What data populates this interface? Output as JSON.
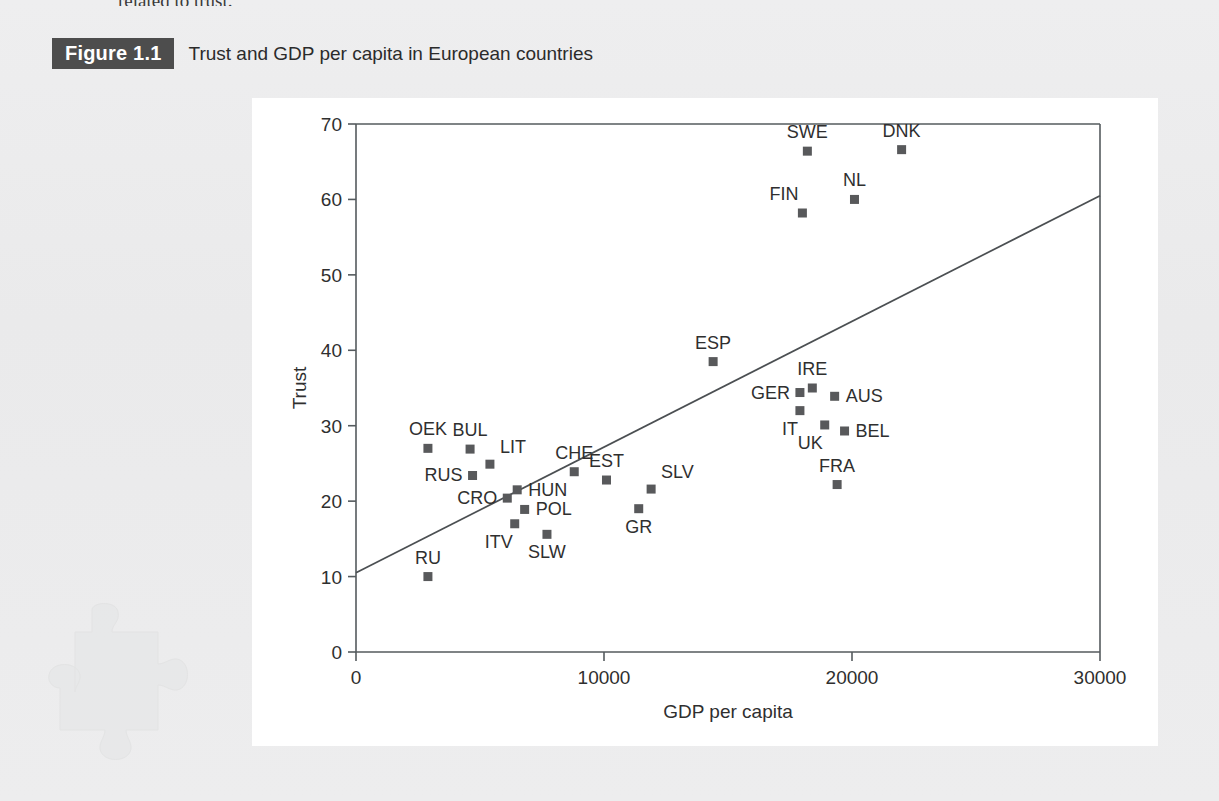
{
  "page": {
    "partial_body_text": "related to trust.",
    "background_color": "#ecedee",
    "panel_color": "#ffffff"
  },
  "figure": {
    "badge_label": "Figure 1.1",
    "badge_bg": "#4d4d4d",
    "title": "Trust and GDP per capita in European countries"
  },
  "watermark": {
    "name": "puzzle-piece",
    "color": "#e3e4e5"
  },
  "chart_data": {
    "type": "scatter",
    "title": "Trust and GDP per capita in European countries",
    "xlabel": "GDP per capita",
    "ylabel": "Trust",
    "xlim": [
      0,
      30000
    ],
    "ylim": [
      0,
      70
    ],
    "xticks": [
      0,
      10000,
      20000,
      30000
    ],
    "yticks": [
      0,
      10,
      20,
      30,
      40,
      50,
      60,
      70
    ],
    "xtick_labels": [
      "0",
      "10000",
      "20000",
      "30000"
    ],
    "ytick_labels": [
      "0",
      "10",
      "20",
      "30",
      "40",
      "50",
      "60",
      "70"
    ],
    "grid": false,
    "legend": "none",
    "marker_color": "#58595b",
    "marker_shape": "square",
    "trendline": {
      "name": "linear-fit",
      "x": [
        0,
        30000
      ],
      "y": [
        10.5,
        60.5
      ],
      "color": "#4b4f52"
    },
    "points": [
      {
        "label": "SWE",
        "x": 18200,
        "y": 66.4,
        "label_pos": "above"
      },
      {
        "label": "DNK",
        "x": 22000,
        "y": 66.6,
        "label_pos": "above"
      },
      {
        "label": "FIN",
        "x": 18000,
        "y": 58.2,
        "label_pos": "above-left"
      },
      {
        "label": "NL",
        "x": 20100,
        "y": 60.0,
        "label_pos": "above"
      },
      {
        "label": "ESP",
        "x": 14400,
        "y": 38.5,
        "label_pos": "above"
      },
      {
        "label": "IRE",
        "x": 18400,
        "y": 35.0,
        "label_pos": "above"
      },
      {
        "label": "GER",
        "x": 17900,
        "y": 34.4,
        "label_pos": "left"
      },
      {
        "label": "AUS",
        "x": 19300,
        "y": 33.9,
        "label_pos": "right"
      },
      {
        "label": "IT",
        "x": 17900,
        "y": 32.0,
        "label_pos": "below-left"
      },
      {
        "label": "UK",
        "x": 18900,
        "y": 30.1,
        "label_pos": "below-left"
      },
      {
        "label": "BEL",
        "x": 19700,
        "y": 29.3,
        "label_pos": "right"
      },
      {
        "label": "FRA",
        "x": 19400,
        "y": 22.2,
        "label_pos": "above"
      },
      {
        "label": "OEK",
        "x": 2900,
        "y": 27.0,
        "label_pos": "above"
      },
      {
        "label": "BUL",
        "x": 4600,
        "y": 26.9,
        "label_pos": "above"
      },
      {
        "label": "LIT",
        "x": 5400,
        "y": 24.9,
        "label_pos": "above-right"
      },
      {
        "label": "RUS",
        "x": 4700,
        "y": 23.4,
        "label_pos": "left"
      },
      {
        "label": "CHE",
        "x": 8800,
        "y": 23.9,
        "label_pos": "above"
      },
      {
        "label": "EST",
        "x": 10100,
        "y": 22.8,
        "label_pos": "above"
      },
      {
        "label": "SLV",
        "x": 11900,
        "y": 21.6,
        "label_pos": "above-right"
      },
      {
        "label": "CRO",
        "x": 6100,
        "y": 20.4,
        "label_pos": "left"
      },
      {
        "label": "HUN",
        "x": 6500,
        "y": 21.5,
        "label_pos": "right"
      },
      {
        "label": "POL",
        "x": 6800,
        "y": 18.9,
        "label_pos": "right"
      },
      {
        "label": "GR",
        "x": 11400,
        "y": 19.0,
        "label_pos": "below"
      },
      {
        "label": "ITV",
        "x": 6400,
        "y": 17.0,
        "label_pos": "below-left"
      },
      {
        "label": "SLW",
        "x": 7700,
        "y": 15.6,
        "label_pos": "below"
      },
      {
        "label": "RU",
        "x": 2900,
        "y": 10.0,
        "label_pos": "above"
      }
    ]
  }
}
